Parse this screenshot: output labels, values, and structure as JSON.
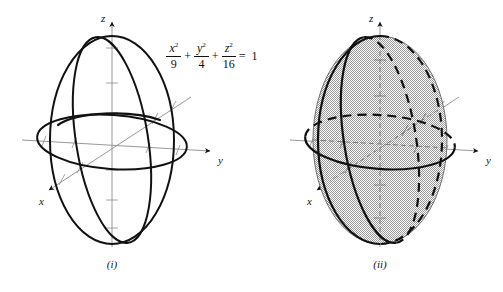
{
  "figure": {
    "background_color": "#ffffff",
    "equation": {
      "terms": [
        {
          "numerator": "x",
          "exponent": "2",
          "denominator": "9"
        },
        {
          "numerator": "y",
          "exponent": "2",
          "denominator": "4"
        },
        {
          "numerator": "z",
          "exponent": "2",
          "denominator": "16"
        }
      ],
      "operator": "+",
      "equals": "=",
      "right_hand_side": "1",
      "plain_text": "x^2/9 + y^2/4 + z^2/16 = 1"
    },
    "panels": [
      {
        "id": "panel-i",
        "caption": "(i)",
        "kind": "wireframe",
        "description": "Ellipsoid traces: three ellipses in the coordinate planes",
        "center": {
          "x": 112,
          "y": 140
        },
        "semi_axes_px": {
          "x": 34,
          "y": 62,
          "z": 104
        },
        "axes": [
          {
            "name": "x",
            "label": "x",
            "label_pos": {
              "x": 39,
              "y": 203
            },
            "tip": {
              "x": 46,
              "y": 187
            }
          },
          {
            "name": "y",
            "label": "y",
            "label_pos": {
              "x": 219,
              "y": 163
            },
            "tip": {
              "x": 213,
              "y": 149
            }
          },
          {
            "name": "z",
            "label": "z",
            "label_pos": {
              "x": 105,
              "y": 20
            },
            "tip": {
              "x": 112,
              "y": 20
            }
          }
        ],
        "curve_color": "#111111",
        "axis_color": "#8c8c8c"
      },
      {
        "id": "panel-ii",
        "caption": "(ii)",
        "kind": "shaded-surface",
        "description": "Full ellipsoid surface with shaded fill and dashed hidden traces",
        "center": {
          "x": 380,
          "y": 140
        },
        "semi_axes_px": {
          "x": 34,
          "y": 62,
          "z": 104
        },
        "axes": [
          {
            "name": "x",
            "label": "x",
            "label_pos": {
              "x": 307,
              "y": 203
            },
            "tip": {
              "x": 314,
              "y": 187
            }
          },
          {
            "name": "y",
            "label": "y",
            "label_pos": {
              "x": 487,
              "y": 163
            },
            "tip": {
              "x": 481,
              "y": 149
            }
          },
          {
            "name": "z",
            "label": "z",
            "label_pos": {
              "x": 373,
              "y": 20
            },
            "tip": {
              "x": 380,
              "y": 20
            }
          }
        ],
        "curve_color": "#111111",
        "axis_color": "#8c8c8c",
        "fill_color": "#b9b9b9",
        "hidden_line_style": "dashed"
      }
    ]
  }
}
